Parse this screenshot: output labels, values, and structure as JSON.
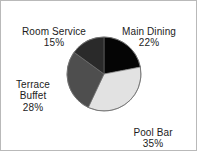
{
  "chart_data": {
    "type": "pie",
    "title": "",
    "categories": [
      "Main Dining",
      "Pool Bar",
      "Terrace Buffet",
      "Room Service"
    ],
    "values": [
      22,
      35,
      28,
      15
    ],
    "unit": "%",
    "legend_position": "outside-labels",
    "grid": false,
    "start_angle_deg": 0,
    "direction": "clockwise",
    "slices": [
      {
        "label": "Main Dining",
        "value": 22,
        "value_text": "22%",
        "color": "#050505"
      },
      {
        "label": "Pool Bar",
        "value": 35,
        "value_text": "35%",
        "color": "#e2e2e2"
      },
      {
        "label": "Terrace Buffet",
        "value": 28,
        "value_text": "28%",
        "color": "#4e4e4e"
      },
      {
        "label": "Room Service",
        "value": 15,
        "value_text": "15%",
        "color": "#2a2a2a"
      }
    ]
  },
  "labels": {
    "room_service": {
      "name": "Room Service",
      "percent": "15%"
    },
    "main_dining": {
      "name": "Main Dining",
      "percent": "22%"
    },
    "terrace_buffet": {
      "name": "Terrace\nBuffet",
      "percent": "28%"
    },
    "pool_bar": {
      "name": "Pool Bar",
      "percent": "35%"
    }
  },
  "geometry": {
    "center_x": 103,
    "center_y": 73,
    "radius": 37
  },
  "colors": {
    "background": "#ffffff",
    "border": "#b9b9b9",
    "text": "#1c1c1c",
    "slice_outline": "#6f6f6f"
  }
}
